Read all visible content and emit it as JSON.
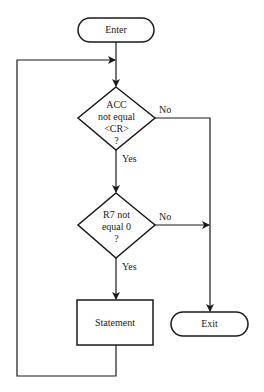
{
  "nodes": {
    "enter": {
      "label": "Enter",
      "shape": "terminal"
    },
    "decision1": {
      "lines": [
        "ACC",
        "not equal",
        "<CR>",
        "?"
      ],
      "shape": "diamond"
    },
    "decision2": {
      "lines": [
        "R7 not",
        "equal 0",
        "?"
      ],
      "shape": "diamond"
    },
    "statement": {
      "label": "Statement",
      "shape": "process"
    },
    "exit": {
      "label": "Exit",
      "shape": "terminal"
    }
  },
  "edges": {
    "d1_no": "No",
    "d1_yes": "Yes",
    "d2_no": "No",
    "d2_yes": "Yes"
  },
  "colors": {
    "stroke": "#1a1a1a",
    "background": "#ffffff"
  }
}
